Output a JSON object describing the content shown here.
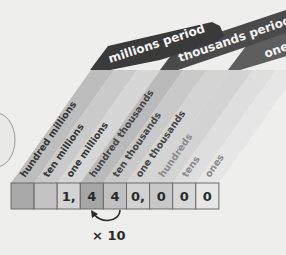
{
  "periods": [
    {
      "label": "millions period",
      "color": "#3a3a3a"
    },
    {
      "label": "thousands period",
      "color": "#4a4a4a"
    },
    {
      "label": "ones",
      "color": "#5e5e5e"
    }
  ],
  "columns": [
    {
      "label": "hundred millions",
      "digit": "",
      "cell_color": "#a9a9a9",
      "stripe_color": "#bdbdbd",
      "text_color": "#333333"
    },
    {
      "label": "ten millions",
      "digit": "",
      "cell_color": "#c4c4c4",
      "stripe_color": "#cacaca",
      "text_color": "#333333"
    },
    {
      "label": "one millions",
      "digit": "1,",
      "cell_color": "#d4d4d4",
      "stripe_color": "#d6d6d6",
      "text_color": "#333333"
    },
    {
      "label": "hundred thousands",
      "digit": "4",
      "cell_color": "#a6a6a6",
      "stripe_color": "#bababa",
      "text_color": "#444444"
    },
    {
      "label": "ten thousands",
      "digit": "4",
      "cell_color": "#c0c0c0",
      "stripe_color": "#c9c9c9",
      "text_color": "#444444"
    },
    {
      "label": "one thousands",
      "digit": "0,",
      "cell_color": "#d2d2d2",
      "stripe_color": "#d4d4d4",
      "text_color": "#444444"
    },
    {
      "label": "hundreds",
      "digit": "0",
      "cell_color": "#c8c8c8",
      "stripe_color": "#d3d3d3",
      "text_color": "#8a8a8a"
    },
    {
      "label": "tens",
      "digit": "0",
      "cell_color": "#d8d8d8",
      "stripe_color": "#dedede",
      "text_color": "#8a8a8a"
    },
    {
      "label": "ones",
      "digit": "0",
      "cell_color": "#e6e6e6",
      "stripe_color": "#e6e6e6",
      "text_color": "#8a8a8a"
    }
  ],
  "annotation": {
    "label": "× 10",
    "arrow": "curved-arrow-from-ten-thousands-to-hundred-thousands"
  }
}
